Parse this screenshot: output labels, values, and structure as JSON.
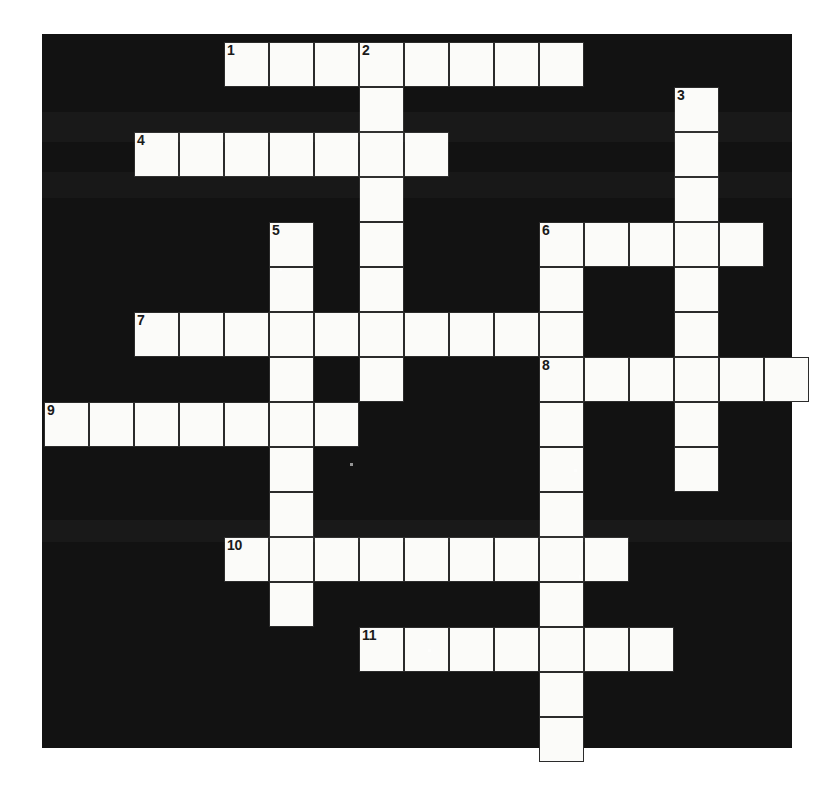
{
  "puzzle": {
    "title": "Crossword Puzzle Grid",
    "type": "crossword",
    "frame": {
      "x": 42,
      "y": 34,
      "width": 750,
      "height": 714
    },
    "cell_size": 45,
    "origin": {
      "x": 44,
      "y": 42
    },
    "columns": 16,
    "rows": 15,
    "colors": {
      "background": "#ffffff",
      "grid_fill": "#121212",
      "cell_fill": "#fbfbf9",
      "cell_border": "#2b2b2b",
      "clue_number": "#1a1a1a"
    },
    "counts": {
      "across_entries": 7,
      "down_entries": 4,
      "numbered_clues": 11
    },
    "entries": [
      {
        "number": "1",
        "direction": "across",
        "row": 0,
        "col": 4,
        "length": 8
      },
      {
        "number": "2",
        "direction": "down",
        "row": 0,
        "col": 7,
        "length": 9
      },
      {
        "number": "3",
        "direction": "down",
        "row": 1,
        "col": 14,
        "length": 9
      },
      {
        "number": "4",
        "direction": "across",
        "row": 2,
        "col": 2,
        "length": 7
      },
      {
        "number": "5",
        "direction": "down",
        "row": 4,
        "col": 5,
        "length": 9
      },
      {
        "number": "6",
        "direction": "across",
        "row": 4,
        "col": 11,
        "length": 5
      },
      {
        "number": "6",
        "direction": "down",
        "row": 4,
        "col": 11,
        "length": 11
      },
      {
        "number": "7",
        "direction": "across",
        "row": 6,
        "col": 2,
        "length": 10
      },
      {
        "number": "8",
        "direction": "across",
        "row": 7,
        "col": 11,
        "length": 6
      },
      {
        "number": "9",
        "direction": "across",
        "row": 8,
        "col": 0,
        "length": 7
      },
      {
        "number": "10",
        "direction": "across",
        "row": 11,
        "col": 4,
        "length": 9
      },
      {
        "number": "11",
        "direction": "across",
        "row": 13,
        "col": 7,
        "length": 7
      }
    ],
    "cells": [
      {
        "row": 0,
        "col": 4,
        "number": "1",
        "letter": ""
      },
      {
        "row": 0,
        "col": 5,
        "number": "",
        "letter": ""
      },
      {
        "row": 0,
        "col": 6,
        "number": "",
        "letter": ""
      },
      {
        "row": 0,
        "col": 7,
        "number": "2",
        "letter": ""
      },
      {
        "row": 0,
        "col": 8,
        "number": "",
        "letter": ""
      },
      {
        "row": 0,
        "col": 9,
        "number": "",
        "letter": ""
      },
      {
        "row": 0,
        "col": 10,
        "number": "",
        "letter": ""
      },
      {
        "row": 0,
        "col": 11,
        "number": "",
        "letter": ""
      },
      {
        "row": 1,
        "col": 7,
        "number": "",
        "letter": ""
      },
      {
        "row": 1,
        "col": 14,
        "number": "3",
        "letter": ""
      },
      {
        "row": 2,
        "col": 2,
        "number": "4",
        "letter": ""
      },
      {
        "row": 2,
        "col": 3,
        "number": "",
        "letter": ""
      },
      {
        "row": 2,
        "col": 4,
        "number": "",
        "letter": ""
      },
      {
        "row": 2,
        "col": 5,
        "number": "",
        "letter": ""
      },
      {
        "row": 2,
        "col": 6,
        "number": "",
        "letter": ""
      },
      {
        "row": 2,
        "col": 7,
        "number": "",
        "letter": ""
      },
      {
        "row": 2,
        "col": 8,
        "number": "",
        "letter": ""
      },
      {
        "row": 2,
        "col": 14,
        "number": "",
        "letter": ""
      },
      {
        "row": 3,
        "col": 7,
        "number": "",
        "letter": ""
      },
      {
        "row": 3,
        "col": 14,
        "number": "",
        "letter": ""
      },
      {
        "row": 4,
        "col": 5,
        "number": "5",
        "letter": ""
      },
      {
        "row": 4,
        "col": 7,
        "number": "",
        "letter": ""
      },
      {
        "row": 4,
        "col": 11,
        "number": "6",
        "letter": ""
      },
      {
        "row": 4,
        "col": 12,
        "number": "",
        "letter": ""
      },
      {
        "row": 4,
        "col": 13,
        "number": "",
        "letter": ""
      },
      {
        "row": 4,
        "col": 14,
        "number": "",
        "letter": ""
      },
      {
        "row": 4,
        "col": 15,
        "number": "",
        "letter": ""
      },
      {
        "row": 5,
        "col": 5,
        "number": "",
        "letter": ""
      },
      {
        "row": 5,
        "col": 7,
        "number": "",
        "letter": ""
      },
      {
        "row": 5,
        "col": 11,
        "number": "",
        "letter": ""
      },
      {
        "row": 5,
        "col": 14,
        "number": "",
        "letter": ""
      },
      {
        "row": 6,
        "col": 2,
        "number": "7",
        "letter": ""
      },
      {
        "row": 6,
        "col": 3,
        "number": "",
        "letter": ""
      },
      {
        "row": 6,
        "col": 4,
        "number": "",
        "letter": ""
      },
      {
        "row": 6,
        "col": 5,
        "number": "",
        "letter": ""
      },
      {
        "row": 6,
        "col": 6,
        "number": "",
        "letter": ""
      },
      {
        "row": 6,
        "col": 7,
        "number": "",
        "letter": ""
      },
      {
        "row": 6,
        "col": 8,
        "number": "",
        "letter": ""
      },
      {
        "row": 6,
        "col": 9,
        "number": "",
        "letter": ""
      },
      {
        "row": 6,
        "col": 10,
        "number": "",
        "letter": ""
      },
      {
        "row": 6,
        "col": 11,
        "number": "",
        "letter": ""
      },
      {
        "row": 6,
        "col": 14,
        "number": "",
        "letter": ""
      },
      {
        "row": 7,
        "col": 5,
        "number": "",
        "letter": ""
      },
      {
        "row": 7,
        "col": 7,
        "number": "",
        "letter": ""
      },
      {
        "row": 7,
        "col": 11,
        "number": "8",
        "letter": ""
      },
      {
        "row": 7,
        "col": 12,
        "number": "",
        "letter": ""
      },
      {
        "row": 7,
        "col": 13,
        "number": "",
        "letter": ""
      },
      {
        "row": 7,
        "col": 14,
        "number": "",
        "letter": ""
      },
      {
        "row": 7,
        "col": 15,
        "number": "",
        "letter": ""
      },
      {
        "row": 7,
        "col": 16,
        "number": "",
        "letter": ""
      },
      {
        "row": 8,
        "col": 0,
        "number": "9",
        "letter": ""
      },
      {
        "row": 8,
        "col": 1,
        "number": "",
        "letter": ""
      },
      {
        "row": 8,
        "col": 2,
        "number": "",
        "letter": ""
      },
      {
        "row": 8,
        "col": 3,
        "number": "",
        "letter": ""
      },
      {
        "row": 8,
        "col": 4,
        "number": "",
        "letter": ""
      },
      {
        "row": 8,
        "col": 5,
        "number": "",
        "letter": ""
      },
      {
        "row": 8,
        "col": 6,
        "number": "",
        "letter": ""
      },
      {
        "row": 8,
        "col": 11,
        "number": "",
        "letter": ""
      },
      {
        "row": 8,
        "col": 14,
        "number": "",
        "letter": ""
      },
      {
        "row": 9,
        "col": 5,
        "number": "",
        "letter": ""
      },
      {
        "row": 9,
        "col": 11,
        "number": "",
        "letter": ""
      },
      {
        "row": 9,
        "col": 14,
        "number": "",
        "letter": ""
      },
      {
        "row": 10,
        "col": 5,
        "number": "",
        "letter": ""
      },
      {
        "row": 10,
        "col": 11,
        "number": "",
        "letter": ""
      },
      {
        "row": 11,
        "col": 4,
        "number": "10",
        "letter": ""
      },
      {
        "row": 11,
        "col": 5,
        "number": "",
        "letter": ""
      },
      {
        "row": 11,
        "col": 6,
        "number": "",
        "letter": ""
      },
      {
        "row": 11,
        "col": 7,
        "number": "",
        "letter": ""
      },
      {
        "row": 11,
        "col": 8,
        "number": "",
        "letter": ""
      },
      {
        "row": 11,
        "col": 9,
        "number": "",
        "letter": ""
      },
      {
        "row": 11,
        "col": 10,
        "number": "",
        "letter": ""
      },
      {
        "row": 11,
        "col": 11,
        "number": "",
        "letter": ""
      },
      {
        "row": 11,
        "col": 12,
        "number": "",
        "letter": ""
      },
      {
        "row": 12,
        "col": 5,
        "number": "",
        "letter": ""
      },
      {
        "row": 12,
        "col": 11,
        "number": "",
        "letter": ""
      },
      {
        "row": 13,
        "col": 7,
        "number": "11",
        "letter": ""
      },
      {
        "row": 13,
        "col": 8,
        "number": "",
        "letter": ""
      },
      {
        "row": 13,
        "col": 9,
        "number": "",
        "letter": ""
      },
      {
        "row": 13,
        "col": 10,
        "number": "",
        "letter": ""
      },
      {
        "row": 13,
        "col": 11,
        "number": "",
        "letter": ""
      },
      {
        "row": 13,
        "col": 12,
        "number": "",
        "letter": ""
      },
      {
        "row": 13,
        "col": 13,
        "number": "",
        "letter": ""
      },
      {
        "row": 14,
        "col": 11,
        "number": "",
        "letter": ""
      },
      {
        "row": 15,
        "col": 11,
        "number": "",
        "letter": ""
      }
    ]
  }
}
